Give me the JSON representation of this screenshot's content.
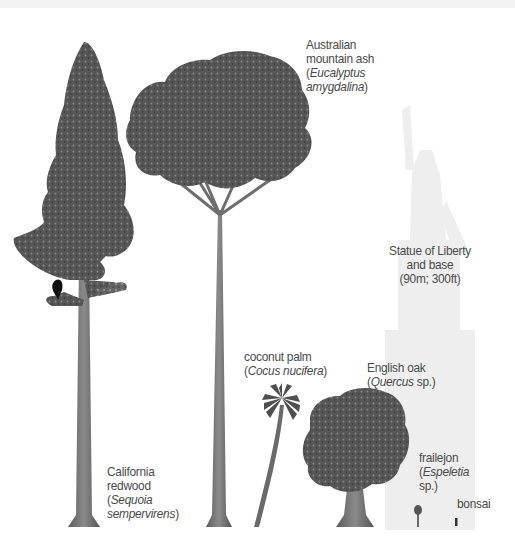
{
  "diagram": {
    "type": "height-comparison-illustration",
    "colors": {
      "background": "#ffffff",
      "foliage": "#5a5a5a",
      "foliage_dark": "#3c3c3c",
      "trunk": "#6e6e6e",
      "statue_ghost": "#ececec",
      "label_text": "#4a4a4a"
    },
    "items": [
      {
        "id": "california-redwood",
        "common_name_lines": [
          "California",
          "redwood"
        ],
        "latin_name_lines": [
          "Sequoia",
          "sempervirens"
        ],
        "paren_open": "(",
        "paren_close": ")"
      },
      {
        "id": "australian-mountain-ash",
        "common_name_lines": [
          "Australian",
          "mountain ash"
        ],
        "latin_name_lines": [
          "Eucalyptus",
          "amygdalina"
        ],
        "paren_open": "(",
        "paren_close": ")"
      },
      {
        "id": "statue-of-liberty",
        "lines": [
          "Statue of Liberty",
          "and base",
          "(90m; 300ft)"
        ]
      },
      {
        "id": "coconut-palm",
        "common_name": "coconut palm",
        "latin_name": "Cocus nucifera",
        "paren_open": "(",
        "paren_close": ")"
      },
      {
        "id": "english-oak",
        "common_name": "English oak",
        "latin_name": "Quercus",
        "latin_suffix": " sp.)",
        "paren_open": "("
      },
      {
        "id": "frailejon",
        "common_name": "frailejon",
        "latin_name": "Espeletia",
        "latin_suffix": "sp.)",
        "paren_open": "("
      },
      {
        "id": "bonsai",
        "common_name": "bonsai"
      }
    ]
  }
}
